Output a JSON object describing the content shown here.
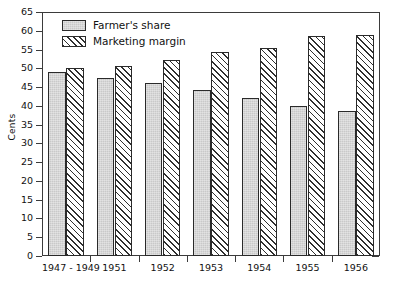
{
  "chart_data": {
    "type": "bar",
    "title": "",
    "xlabel": "",
    "ylabel": "Cents",
    "ylim": [
      0,
      65
    ],
    "ytick_step": 5,
    "grid": false,
    "legend_position": "top-left",
    "categories": [
      "1947 - 1949",
      "1951",
      "1952",
      "1953",
      "1954",
      "1955",
      "1956"
    ],
    "yticks": [
      "0",
      "5",
      "10",
      "15",
      "20",
      "25",
      "30",
      "35",
      "40",
      "45",
      "50",
      "55",
      "60",
      "65"
    ],
    "series": [
      {
        "name": "Farmer's share",
        "fill": "solid-gray",
        "values": [
          49,
          47.5,
          46,
          44.3,
          42,
          40,
          38.5
        ]
      },
      {
        "name": "Marketing margin",
        "fill": "diagonal-hatch",
        "values": [
          50,
          50.7,
          52.3,
          54.3,
          55.5,
          58.7,
          59
        ]
      }
    ],
    "colors": {
      "series_1_fill": "#c9c9c9",
      "series_2_fill": "#ffffff",
      "hatch_line": "#2f2f2f",
      "bar_outline": "#2a2a2a",
      "axis": "#3b3b3b",
      "text": "#111111",
      "background": "#ffffff"
    }
  }
}
